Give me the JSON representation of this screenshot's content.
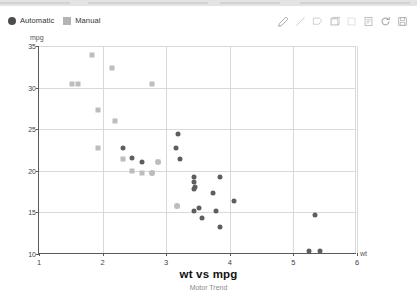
{
  "topbar": {
    "present": true
  },
  "legend": {
    "items": [
      {
        "label": "Automatic",
        "marker": "circle",
        "color": "#4d4d4d"
      },
      {
        "label": "Manual",
        "marker": "square",
        "color": "#b3b3b3"
      }
    ]
  },
  "toolbar": {
    "tools": [
      {
        "name": "pencil-icon",
        "title": "Pencil"
      },
      {
        "name": "line-icon",
        "title": "Line"
      },
      {
        "name": "polygon-icon",
        "title": "Polygon"
      },
      {
        "name": "rectangle-icon",
        "title": "Rectangle"
      },
      {
        "name": "square-icon",
        "title": "Square"
      },
      {
        "name": "note-icon",
        "title": "Note"
      },
      {
        "name": "refresh-icon",
        "title": "Refresh"
      },
      {
        "name": "save-icon",
        "title": "Save"
      }
    ]
  },
  "chart_data": {
    "type": "scatter",
    "title": "wt vs mpg",
    "subtitle": "Motor Trend",
    "xlabel": "wt",
    "ylabel": "mpg",
    "xlim": [
      1,
      6
    ],
    "ylim": [
      10,
      35
    ],
    "xticks": [
      1,
      2,
      3,
      4,
      5,
      6
    ],
    "yticks": [
      10,
      15,
      20,
      25,
      30,
      35
    ],
    "grid": true,
    "legend_position": "top-left",
    "series": [
      {
        "name": "Automatic",
        "marker": "circle",
        "color": "#5e5e5e",
        "points": [
          {
            "x": 2.62,
            "y": 21.0
          },
          {
            "x": 2.875,
            "y": 21.0
          },
          {
            "x": 2.32,
            "y": 22.8
          },
          {
            "x": 3.215,
            "y": 21.4
          },
          {
            "x": 3.44,
            "y": 18.7
          },
          {
            "x": 3.46,
            "y": 18.1
          },
          {
            "x": 3.57,
            "y": 14.3
          },
          {
            "x": 3.19,
            "y": 24.4
          },
          {
            "x": 3.15,
            "y": 22.8
          },
          {
            "x": 3.44,
            "y": 19.2
          },
          {
            "x": 3.44,
            "y": 17.8
          },
          {
            "x": 4.07,
            "y": 16.4
          },
          {
            "x": 3.73,
            "y": 17.3
          },
          {
            "x": 3.78,
            "y": 15.2
          },
          {
            "x": 5.25,
            "y": 10.4
          },
          {
            "x": 5.424,
            "y": 10.4
          },
          {
            "x": 5.345,
            "y": 14.7
          },
          {
            "x": 2.465,
            "y": 21.5
          },
          {
            "x": 3.52,
            "y": 15.5
          },
          {
            "x": 3.435,
            "y": 15.2
          },
          {
            "x": 3.84,
            "y": 13.3
          },
          {
            "x": 3.845,
            "y": 19.2
          },
          {
            "x": 2.77,
            "y": 19.7
          },
          {
            "x": 3.17,
            "y": 15.8
          }
        ]
      },
      {
        "name": "Manual",
        "marker": "square",
        "color": "#bdbdbd",
        "points": [
          {
            "x": 1.513,
            "y": 30.4
          },
          {
            "x": 1.615,
            "y": 30.4
          },
          {
            "x": 1.835,
            "y": 33.9
          },
          {
            "x": 1.935,
            "y": 27.3
          },
          {
            "x": 2.14,
            "y": 32.4
          },
          {
            "x": 2.2,
            "y": 26.0
          },
          {
            "x": 2.78,
            "y": 30.4
          },
          {
            "x": 1.935,
            "y": 22.8
          },
          {
            "x": 2.32,
            "y": 21.4
          },
          {
            "x": 2.62,
            "y": 19.7
          },
          {
            "x": 2.875,
            "y": 21.0
          },
          {
            "x": 3.17,
            "y": 15.8
          },
          {
            "x": 2.77,
            "y": 19.7
          },
          {
            "x": 2.465,
            "y": 20.0
          }
        ]
      }
    ]
  }
}
